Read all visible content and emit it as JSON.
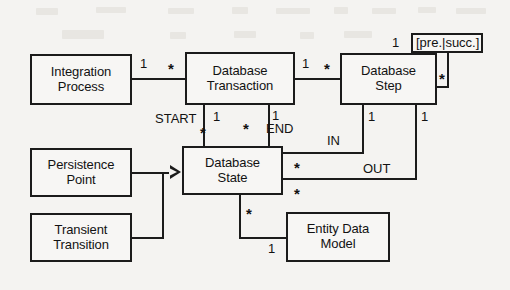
{
  "diagram": {
    "type": "uml-class-diagram",
    "title": "",
    "background_color": "#f4f3f1",
    "line_color": "#1b1b1b",
    "text_color": "#121212",
    "classes": [
      {
        "id": "integration_process",
        "name": "Integration\nProcess"
      },
      {
        "id": "database_transaction",
        "name": "Database\nTransaction"
      },
      {
        "id": "database_step",
        "name": "Database\nStep"
      },
      {
        "id": "persistence_point",
        "name": "Persistence\nPoint"
      },
      {
        "id": "transient_transition",
        "name": "Transient\nTransition"
      },
      {
        "id": "database_state",
        "name": "Database\nState"
      },
      {
        "id": "entity_data_model",
        "name": "Entity Data\nModel"
      }
    ],
    "associations": [
      {
        "id": "ip_dt",
        "from": "integration_process",
        "to": "database_transaction",
        "from_mult": "1",
        "to_mult": "*",
        "role": ""
      },
      {
        "id": "dt_ds",
        "from": "database_transaction",
        "to": "database_step",
        "from_mult": "1",
        "to_mult": "*",
        "role": ""
      },
      {
        "id": "step_self",
        "from": "database_step",
        "to": "database_step",
        "from_mult": "1",
        "to_mult": "*",
        "role": "[pre.|succ.]"
      },
      {
        "id": "dt_start",
        "from": "database_transaction",
        "to": "database_state",
        "from_mult": "1",
        "to_mult": "*",
        "role": "START"
      },
      {
        "id": "dt_end",
        "from": "database_transaction",
        "to": "database_state",
        "from_mult": "1",
        "to_mult": "*",
        "role": "END"
      },
      {
        "id": "step_in",
        "from": "database_step",
        "to": "database_state",
        "from_mult": "1",
        "to_mult": "*",
        "role": "IN"
      },
      {
        "id": "step_out",
        "from": "database_step",
        "to": "database_state",
        "from_mult": "1",
        "to_mult": "*",
        "role": "OUT"
      },
      {
        "id": "dstate_edm",
        "from": "database_state",
        "to": "entity_data_model",
        "from_mult": "*",
        "to_mult": "1",
        "role": ""
      }
    ],
    "generalizations": [
      {
        "id": "pp_gen",
        "from": "persistence_point",
        "to": "database_state"
      },
      {
        "id": "tt_gen",
        "from": "transient_transition",
        "to": "database_state"
      }
    ],
    "labels": {
      "mult_one": "1",
      "mult_many": "*",
      "role_start": "START",
      "role_end": "END",
      "role_in": "IN",
      "role_out": "OUT",
      "role_pre_succ": "[pre.|succ.]"
    }
  }
}
